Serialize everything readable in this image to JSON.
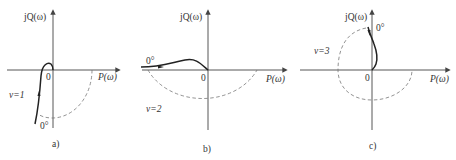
{
  "figure": {
    "panels": [
      {
        "id": "a",
        "caption": "a)",
        "y_axis_label": "jQ(ω)",
        "x_axis_label": "P(ω)",
        "origin_label": "0",
        "type_label": "v=1",
        "angle_label": "0°"
      },
      {
        "id": "b",
        "caption": "b)",
        "y_axis_label": "jQ(ω)",
        "x_axis_label": "P(ω)",
        "origin_label": "0",
        "type_label": "v=2",
        "angle_label": "0°"
      },
      {
        "id": "c",
        "caption": "c)",
        "y_axis_label": "jQ(ω)",
        "x_axis_label": "P(ω)",
        "origin_label": "0",
        "type_label": "v=3",
        "angle_label": "0°"
      }
    ],
    "colors": {
      "axis": "#444444",
      "curve": "#222222",
      "dashed_arc": "#777777",
      "text": "#333333"
    }
  }
}
